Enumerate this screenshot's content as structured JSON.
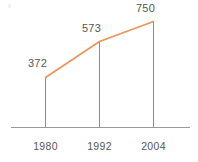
{
  "chart_data": {
    "type": "line",
    "title": "",
    "subtitle": "",
    "xlabel": "",
    "ylabel": "",
    "categories": [
      "1980",
      "1992",
      "2004"
    ],
    "x": [
      1980,
      1992,
      2004
    ],
    "values": [
      372,
      573,
      750
    ],
    "data_labels": [
      "372",
      "573",
      "750"
    ],
    "series": [
      {
        "name": "",
        "values": [
          372,
          573,
          750
        ],
        "color": "#e8945a"
      }
    ],
    "ylim": [
      0,
      830
    ],
    "grid": false,
    "legend": false,
    "legend_position": "none",
    "axis_line_color": "#9a9a9a",
    "stem_color": "#8c8c8c",
    "label_color": "#565656",
    "background": "#ffffff",
    "annotations": []
  },
  "points": [
    {
      "label": "1980",
      "value": "372",
      "cx": 45.5,
      "cy": 77.5,
      "value_label_x": 28,
      "value_label_y": 57
    },
    {
      "label": "1992",
      "value": "573",
      "cx": 99.5,
      "cy": 41.5,
      "value_label_x": 82,
      "value_label_y": 22
    },
    {
      "label": "2004",
      "value": "750",
      "cx": 153.5,
      "cy": 21.5,
      "value_label_x": 136,
      "value_label_y": 2
    }
  ],
  "axis": {
    "baseline_y": 127.5,
    "x_start": 11,
    "x_end": 190
  }
}
